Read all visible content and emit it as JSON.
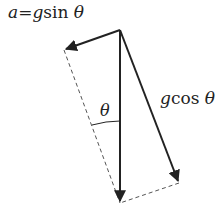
{
  "labels": {
    "tangential": {
      "var": "a",
      "eq": "=",
      "g": "g",
      "fn": "sin",
      "theta": "θ"
    },
    "normal": {
      "g": "g",
      "fn": "cos",
      "theta": "θ"
    },
    "angle": "θ"
  },
  "geometry": {
    "origin": [
      120,
      30
    ],
    "gravity_tip": [
      120,
      203
    ],
    "sin_tip": [
      64,
      50
    ],
    "cos_tip": [
      179,
      183
    ]
  },
  "colors": {
    "stroke": "#222222",
    "dashed": "#555555",
    "background": "#ffffff"
  }
}
